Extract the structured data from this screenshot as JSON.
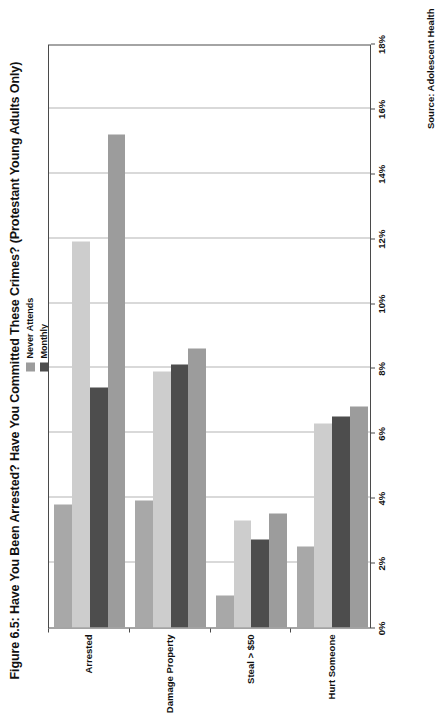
{
  "figure": {
    "title": "Figure 6.5: Have You Been Arrested?  Have You Committed These Crimes? (Protestant Young Adults Only)",
    "source": "Source: Adolescent Health"
  },
  "legend": {
    "items": [
      {
        "label": "Never Attends",
        "color": "#9c9c9c"
      },
      {
        "label": "Monthly",
        "color": "#4d4d4d"
      },
      {
        "label": "Yearly",
        "color": "#cdcdcd"
      },
      {
        "label": "Weekly",
        "color": "#a8a8a8"
      }
    ]
  },
  "chart_data": {
    "type": "bar",
    "orientation": "horizontal",
    "title": "Figure 6.5: Have You Been Arrested?  Have You Committed These Crimes? (Protestant Young Adults Only)",
    "xlabel": "",
    "ylabel": "",
    "grid": true,
    "legend_position": "top-right",
    "categories": [
      "Arrested",
      "Damage Property",
      "Steal > $50",
      "Hurt Someone"
    ],
    "tick_labels": [
      "0%",
      "2%",
      "4%",
      "6%",
      "8%",
      "10%",
      "12%",
      "14%",
      "16%",
      "18%"
    ],
    "tick_values": [
      0,
      2,
      4,
      6,
      8,
      10,
      12,
      14,
      16,
      18
    ],
    "xlim": [
      0,
      18
    ],
    "unit": "%",
    "series": [
      {
        "name": "Never Attends",
        "color": "#9c9c9c",
        "values": [
          15.2,
          8.6,
          3.5,
          6.8
        ]
      },
      {
        "name": "Monthly",
        "color": "#4d4d4d",
        "values": [
          7.4,
          8.1,
          2.7,
          6.5
        ]
      },
      {
        "name": "Yearly",
        "color": "#cdcdcd",
        "values": [
          11.9,
          7.9,
          3.3,
          6.3
        ]
      },
      {
        "name": "Weekly",
        "color": "#a8a8a8",
        "values": [
          3.8,
          3.9,
          1.0,
          2.5
        ]
      }
    ],
    "source": "Source: Adolescent Health"
  }
}
